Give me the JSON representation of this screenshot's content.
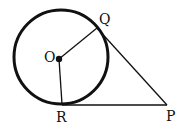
{
  "diagram": {
    "labels": {
      "O": "O",
      "Q": "Q",
      "R": "R",
      "P": "P"
    },
    "points": {
      "O": [
        59,
        59
      ],
      "Q": [
        97,
        28
      ],
      "R": [
        62,
        104
      ],
      "P": [
        167,
        105
      ]
    },
    "circle": {
      "cx": 61,
      "cy": 57,
      "r": 47
    },
    "color": "#111111"
  }
}
